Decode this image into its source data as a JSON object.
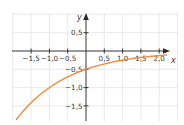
{
  "chart_data": {
    "type": "line",
    "title": "",
    "xlabel": "x",
    "ylabel": "y",
    "xlim": [
      -2.0,
      2.5
    ],
    "ylim": [
      -1.9,
      1.0
    ],
    "grid": true,
    "grid_step": 0.5,
    "x_ticks": [
      -1.5,
      -1.0,
      -0.5,
      0.5,
      1.0,
      1.5,
      2.0
    ],
    "x_tick_labels": [
      "−1,5",
      "−1,0",
      "−0,5",
      "0,5",
      "1,0",
      "1,5",
      "2,0"
    ],
    "y_ticks": [
      0.5,
      -0.5,
      -1.0,
      -1.5
    ],
    "y_tick_labels": [
      "0,5",
      "−0,5",
      "−1,0",
      "−1,5"
    ],
    "series": [
      {
        "name": "y = -0.5·2^(-x)",
        "color": "#f08a3c",
        "x": [
          -1.9,
          -1.5,
          -1.0,
          -0.5,
          0.0,
          0.5,
          1.0,
          1.5,
          2.0,
          2.2
        ],
        "y": [
          -1.87,
          -1.41,
          -1.0,
          -0.71,
          -0.5,
          -0.35,
          -0.25,
          -0.18,
          -0.125,
          -0.11
        ]
      }
    ]
  },
  "labels": {
    "x_axis": "x",
    "y_axis": "y"
  },
  "colors": {
    "curve": "#f08a3c",
    "grid": "#e4e4e4",
    "axis": "#2a2a2a"
  }
}
